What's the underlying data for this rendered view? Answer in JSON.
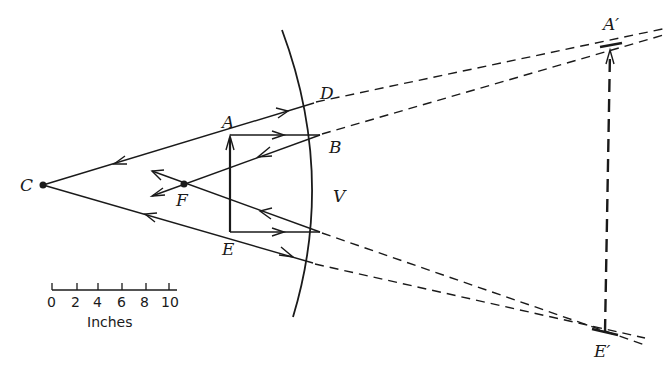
{
  "diagram": {
    "colors": {
      "ink": "#1a1a1a",
      "background": "#ffffff"
    },
    "points": {
      "C": {
        "label": "C",
        "x": 43,
        "y": 185
      },
      "F": {
        "label": "F",
        "x": 184,
        "y": 184
      },
      "A": {
        "label": "A",
        "x": 230,
        "y": 135
      },
      "E": {
        "label": "E",
        "x": 230,
        "y": 232
      },
      "D": {
        "label": "D",
        "x": 314,
        "y": 103
      },
      "B": {
        "label": "B",
        "x": 320,
        "y": 135
      },
      "V": {
        "label": "V",
        "x": 325,
        "y": 185
      },
      "A_prime": {
        "label": "A′",
        "x": 610,
        "y": 45
      },
      "E_prime": {
        "label": "E′",
        "x": 605,
        "y": 332
      }
    },
    "labels": {
      "C": "C",
      "F": "F",
      "A": "A",
      "E": "E",
      "D": "D",
      "B": "B",
      "V": "V",
      "A_prime": "A′",
      "E_prime": "E′"
    },
    "scale_bar": {
      "ticks": [
        "0",
        "2",
        "4",
        "6",
        "8",
        "10"
      ],
      "unit": "Inches"
    }
  }
}
